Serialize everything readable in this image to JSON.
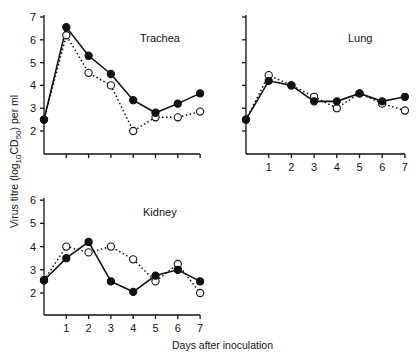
{
  "chart_data": [
    {
      "type": "line",
      "title": "Trachea",
      "xlabel": "",
      "ylabel": "Virus titre (log10CD50) per ml",
      "x": [
        0,
        1,
        2,
        3,
        4,
        5,
        6,
        7
      ],
      "xticks": [],
      "yticks": [
        "7",
        "6",
        "5",
        "4",
        "3",
        "2"
      ],
      "ylim": [
        1,
        7
      ],
      "xlim": [
        0,
        7
      ],
      "series": [
        {
          "name": "filled circles (solid line)",
          "marker": "filled",
          "values": [
            2.5,
            6.55,
            5.3,
            4.5,
            3.35,
            2.8,
            3.2,
            3.65
          ]
        },
        {
          "name": "open circles (dotted line)",
          "marker": "open",
          "values": [
            2.5,
            6.2,
            4.55,
            4.0,
            2.0,
            2.6,
            2.6,
            2.85
          ]
        }
      ]
    },
    {
      "type": "line",
      "title": "Lung",
      "xlabel": "",
      "ylabel": "",
      "x": [
        0,
        1,
        2,
        3,
        4,
        5,
        6,
        7
      ],
      "xticks": [
        "1",
        "2",
        "3",
        "4",
        "5",
        "6",
        "7"
      ],
      "yticks": [],
      "ylim": [
        1,
        7
      ],
      "xlim": [
        0,
        7
      ],
      "series": [
        {
          "name": "filled circles (solid line)",
          "marker": "filled",
          "values": [
            2.5,
            4.2,
            4.0,
            3.3,
            3.3,
            3.65,
            3.3,
            3.5
          ]
        },
        {
          "name": "open circles (dotted line)",
          "marker": "open",
          "values": [
            2.5,
            4.45,
            4.0,
            3.5,
            3.0,
            3.65,
            3.2,
            2.9
          ]
        }
      ]
    },
    {
      "type": "line",
      "title": "Kidney",
      "xlabel": "Days after inoculation",
      "ylabel": "",
      "x": [
        0,
        1,
        2,
        3,
        4,
        5,
        6,
        7
      ],
      "xticks": [
        "1",
        "2",
        "3",
        "4",
        "5",
        "6",
        "7"
      ],
      "yticks": [
        "6",
        "5",
        "4",
        "3",
        "2"
      ],
      "ylim": [
        1,
        6
      ],
      "xlim": [
        0,
        7
      ],
      "series": [
        {
          "name": "filled circles (solid line)",
          "marker": "filled",
          "values": [
            2.55,
            3.5,
            4.2,
            2.5,
            2.05,
            2.75,
            3.0,
            2.5
          ]
        },
        {
          "name": "open circles (dotted line)",
          "marker": "open",
          "values": [
            2.55,
            4.0,
            3.75,
            4.0,
            3.45,
            2.5,
            3.25,
            2.0
          ]
        }
      ]
    }
  ],
  "labels": {
    "ylabel_prefix": "Virus titre (log",
    "ylabel_sub1": "10",
    "ylabel_mid": "CD",
    "ylabel_sub2": "50",
    "ylabel_suffix": ") per ml",
    "xlabel": "Days after inoculation"
  }
}
